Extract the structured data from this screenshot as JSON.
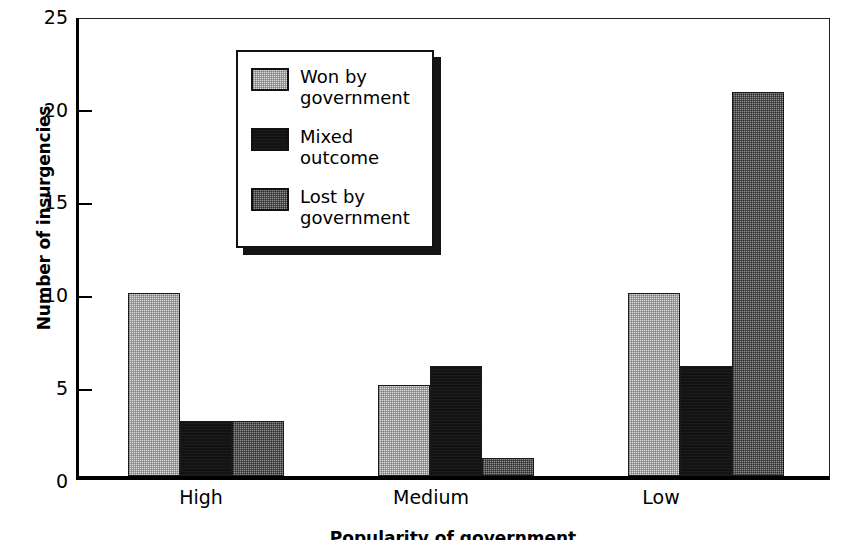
{
  "chart_data": {
    "type": "bar",
    "title": "",
    "xlabel": "Popularity of government",
    "ylabel": "Number of insurgencies",
    "categories": [
      "High",
      "Medium",
      "Low"
    ],
    "series": [
      {
        "name": "Won by\ngovernment",
        "key": "won",
        "color": "#dcdcdc",
        "fill": "light",
        "values": [
          10,
          5,
          10
        ]
      },
      {
        "name": "Mixed\noutcome",
        "key": "mixed",
        "color": "#121212",
        "fill": "dark",
        "values": [
          3,
          6,
          6
        ]
      },
      {
        "name": "Lost by\ngovernment",
        "key": "lost",
        "color": "#8e8e8e",
        "fill": "medium",
        "values": [
          3,
          1,
          21
        ]
      }
    ],
    "ylim": [
      0,
      25
    ],
    "yticks": [
      0,
      5,
      10,
      15,
      20,
      25
    ],
    "ytick_labels": [
      "0",
      "5",
      "10",
      "15",
      "20",
      "25"
    ],
    "grid": false,
    "legend_position": "upper-center",
    "legend_entries": [
      "Won by\ngovernment",
      "Mixed\noutcome",
      "Lost by\ngovernment"
    ]
  },
  "axes": {
    "y_title": "Number of insurgencies",
    "x_title": "Popularity of government",
    "y_tick_0": "0",
    "y_tick_1": "5",
    "y_tick_2": "10",
    "y_tick_3": "15",
    "y_tick_4": "20",
    "y_tick_5": "25",
    "x_tick_0": "High",
    "x_tick_1": "Medium",
    "x_tick_2": "Low"
  },
  "legend": {
    "item_0": "Won by\ngovernment",
    "item_1": "Mixed\noutcome",
    "item_2": "Lost by\ngovernment"
  }
}
